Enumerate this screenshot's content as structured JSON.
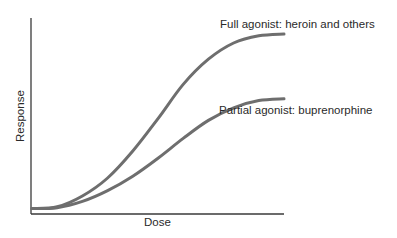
{
  "chart_data": {
    "type": "line",
    "title": "",
    "xlabel": "Dose",
    "ylabel": "Response",
    "grid": false,
    "legend_position": "inline labels at curve ends",
    "x": [
      0,
      0.1,
      0.2,
      0.3,
      0.4,
      0.5,
      0.6,
      0.7,
      0.8,
      0.9,
      1.0
    ],
    "series": [
      {
        "name": "Full agonist: heroin and others",
        "values": [
          0.03,
          0.04,
          0.1,
          0.2,
          0.35,
          0.53,
          0.72,
          0.86,
          0.95,
          0.99,
          1.0
        ]
      },
      {
        "name": "Partial agonist: buprenorphine",
        "values": [
          0.03,
          0.035,
          0.07,
          0.13,
          0.21,
          0.31,
          0.42,
          0.52,
          0.59,
          0.63,
          0.64
        ]
      }
    ],
    "xlim": [
      0,
      1
    ],
    "ylim": [
      0,
      1.1
    ],
    "colors": {
      "curve": "#6e6e6e",
      "axis": "#3a3a3a",
      "text": "#2a2a2a"
    }
  },
  "labels": {
    "full_agonist": "Full agonist: heroin and others",
    "partial_agonist": "Partial agonist: buprenorphine",
    "xlabel": "Dose",
    "ylabel": "Response"
  }
}
